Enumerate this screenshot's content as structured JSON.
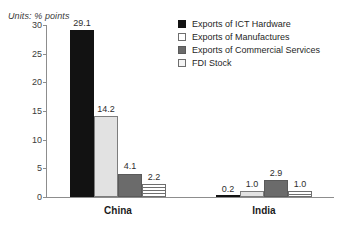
{
  "chart_data": {
    "type": "bar",
    "title": "",
    "subtitle": "",
    "units_caption": "Units: % points",
    "xlabel": "",
    "ylabel": "",
    "ylim": [
      0,
      30
    ],
    "ytick_labels": [
      "30",
      "25",
      "20",
      "15",
      "10",
      "5",
      "0"
    ],
    "ytick_values": [
      30,
      25,
      20,
      15,
      10,
      5,
      0
    ],
    "grid": false,
    "legend_position": "top-right",
    "categories": [
      "China",
      "India"
    ],
    "series": [
      {
        "name": "Exports of ICT Hardware",
        "color": "#121212",
        "values": [
          29.1,
          0.2
        ],
        "labels": [
          "29.1",
          "0.2"
        ]
      },
      {
        "name": "Exports of Manufactures",
        "color": "#e2e2e2",
        "values": [
          14.2,
          1.0
        ],
        "labels": [
          "14.2",
          "1.0"
        ]
      },
      {
        "name": "Exports of Commercial Services",
        "color": "#6b6b6b",
        "values": [
          4.1,
          2.9
        ],
        "labels": [
          "4.1",
          "2.9"
        ]
      },
      {
        "name": "FDI Stock",
        "color": "#f2f2f2",
        "values": [
          2.2,
          1.0
        ],
        "labels": [
          "2.2",
          "1.0"
        ]
      }
    ]
  },
  "legend": {
    "items": [
      {
        "label": "Exports of ICT Hardware"
      },
      {
        "label": "Exports of Manufactures"
      },
      {
        "label": "Exports of Commercial Services"
      },
      {
        "label": "FDI Stock"
      }
    ]
  }
}
